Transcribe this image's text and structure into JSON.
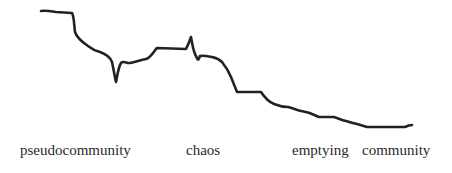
{
  "diagram": {
    "type": "stage-progression-curve",
    "line_color": "#222222",
    "background_color": "#ffffff",
    "stages": [
      {
        "label": "pseudocommunity",
        "x": 20
      },
      {
        "label": "chaos",
        "x": 186
      },
      {
        "label": "emptying",
        "x": 292
      },
      {
        "label": "community",
        "x": 362
      }
    ]
  }
}
